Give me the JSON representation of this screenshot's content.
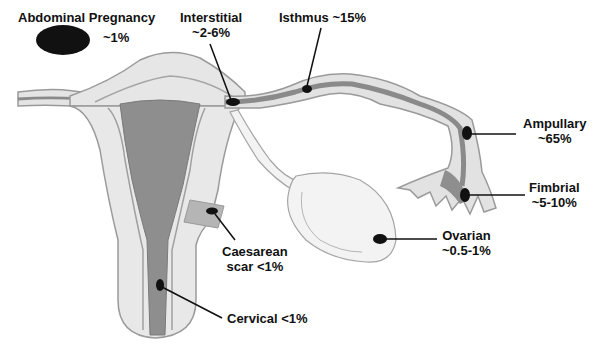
{
  "diagram": {
    "colors": {
      "outer_tissue": "#e6e6e6",
      "outline": "#9a9a9a",
      "inner_layer": "#cfcfcf",
      "cavity": "#8e8e8e",
      "ovary": "#f0f0f0",
      "marker": "#111111"
    },
    "labels": [
      {
        "id": "abdominal",
        "line1": "Abdominal Pregnancy",
        "line2": "~1%"
      },
      {
        "id": "interstitial",
        "line1": "Interstitial",
        "line2": "~2-6%"
      },
      {
        "id": "isthmus",
        "line1": "Isthmus ~15%"
      },
      {
        "id": "ampullary",
        "line1": "Ampullary",
        "line2": "~65%"
      },
      {
        "id": "fimbrial",
        "line1": "Fimbrial",
        "line2": "~5-10%"
      },
      {
        "id": "ovarian",
        "line1": "Ovarian",
        "line2": "~0.5-1%"
      },
      {
        "id": "caesarean",
        "line1": "Caesarean",
        "line2": "scar <1%"
      },
      {
        "id": "cervical",
        "line1": "Cervical <1%"
      }
    ]
  }
}
